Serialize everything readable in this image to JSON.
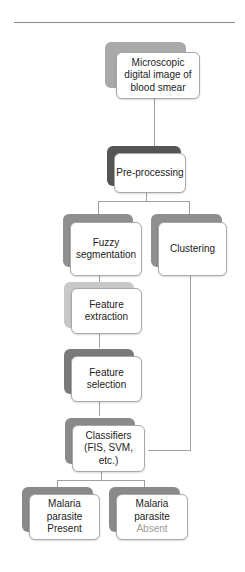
{
  "diagram": {
    "type": "flowchart",
    "nodes": {
      "input": {
        "lines": [
          "Microscopic",
          "digital image of",
          "blood smear"
        ],
        "shade": "#a9a9a9"
      },
      "preprocessing": {
        "lines": [
          "Pre-processing"
        ],
        "shade": "#555555"
      },
      "fuzzy": {
        "lines": [
          "Fuzzy",
          "segmentation"
        ],
        "shade": "#8f8f8f"
      },
      "clustering": {
        "lines": [
          "Clustering"
        ],
        "shade": "#8f8f8f"
      },
      "extraction": {
        "lines": [
          "Feature",
          "extraction"
        ],
        "shade": "#c8c8c8"
      },
      "selection": {
        "lines": [
          "Feature",
          "selection"
        ],
        "shade": "#7a7a7a"
      },
      "classifiers": {
        "lines": [
          "Classifiers",
          "(FIS, SVM, etc.)"
        ],
        "shade": "#8a8a8a"
      },
      "present": {
        "lines": [
          "Malaria",
          "parasite",
          "Present"
        ],
        "shade": "#8a8a8a"
      },
      "absent": {
        "lines": [
          "Malaria",
          "parasite",
          "Absent"
        ],
        "shade": "#8a8a8a"
      }
    },
    "edges": [
      [
        "input",
        "preprocessing"
      ],
      [
        "preprocessing",
        "fuzzy"
      ],
      [
        "preprocessing",
        "clustering"
      ],
      [
        "fuzzy",
        "extraction"
      ],
      [
        "extraction",
        "selection"
      ],
      [
        "selection",
        "classifiers"
      ],
      [
        "clustering",
        "classifiers"
      ],
      [
        "classifiers",
        "present"
      ],
      [
        "classifiers",
        "absent"
      ]
    ]
  }
}
